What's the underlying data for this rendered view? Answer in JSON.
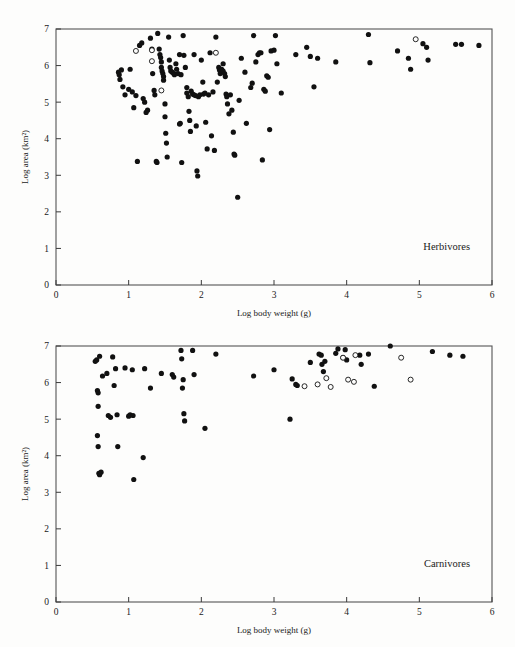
{
  "figure": {
    "background_color": "#fdfdfc",
    "point_color": "#111111",
    "axis_color": "#3a3a3a"
  },
  "chart_data": [
    {
      "type": "scatter",
      "title": "Herbivores",
      "xlabel": "Log body weight (g)",
      "ylabel": "Log area (km²)",
      "xlim": [
        0,
        6
      ],
      "ylim": [
        0,
        7
      ],
      "xticks": [
        0,
        1,
        2,
        3,
        4,
        5,
        6
      ],
      "yticks": [
        0,
        1,
        2,
        3,
        4,
        5,
        6,
        7
      ],
      "grid": false,
      "legend": "none",
      "annotation": "Herbivores",
      "annotation_position": "bottom-right",
      "series": [
        {
          "name": "filled",
          "marker": "filled-circle",
          "points": [
            [
              0.86,
              5.82
            ],
            [
              0.87,
              5.75
            ],
            [
              0.9,
              5.88
            ],
            [
              0.88,
              5.62
            ],
            [
              0.92,
              5.42
            ],
            [
              0.95,
              5.2
            ],
            [
              1.0,
              5.35
            ],
            [
              1.02,
              5.9
            ],
            [
              1.05,
              5.28
            ],
            [
              1.07,
              4.85
            ],
            [
              1.1,
              5.18
            ],
            [
              1.12,
              3.38
            ],
            [
              1.15,
              6.55
            ],
            [
              1.18,
              6.62
            ],
            [
              1.2,
              5.1
            ],
            [
              1.22,
              5.0
            ],
            [
              1.24,
              4.72
            ],
            [
              1.26,
              4.78
            ],
            [
              1.3,
              6.75
            ],
            [
              1.32,
              6.45
            ],
            [
              1.33,
              5.78
            ],
            [
              1.35,
              5.32
            ],
            [
              1.36,
              5.2
            ],
            [
              1.38,
              3.38
            ],
            [
              1.39,
              3.35
            ],
            [
              1.4,
              6.88
            ],
            [
              1.42,
              6.45
            ],
            [
              1.43,
              6.3
            ],
            [
              1.44,
              6.22
            ],
            [
              1.45,
              6.1
            ],
            [
              1.45,
              5.95
            ],
            [
              1.46,
              5.85
            ],
            [
              1.47,
              5.78
            ],
            [
              1.48,
              5.7
            ],
            [
              1.48,
              5.6
            ],
            [
              1.5,
              4.95
            ],
            [
              1.5,
              4.6
            ],
            [
              1.51,
              4.15
            ],
            [
              1.52,
              3.88
            ],
            [
              1.53,
              3.5
            ],
            [
              1.55,
              6.78
            ],
            [
              1.56,
              6.15
            ],
            [
              1.57,
              5.95
            ],
            [
              1.58,
              5.85
            ],
            [
              1.6,
              5.82
            ],
            [
              1.62,
              5.78
            ],
            [
              1.63,
              5.75
            ],
            [
              1.65,
              6.05
            ],
            [
              1.66,
              5.9
            ],
            [
              1.68,
              5.78
            ],
            [
              1.7,
              6.3
            ],
            [
              1.7,
              4.4
            ],
            [
              1.71,
              4.42
            ],
            [
              1.72,
              5.75
            ],
            [
              1.73,
              3.35
            ],
            [
              1.75,
              6.82
            ],
            [
              1.76,
              6.28
            ],
            [
              1.78,
              5.95
            ],
            [
              1.8,
              5.4
            ],
            [
              1.8,
              5.25
            ],
            [
              1.82,
              5.15
            ],
            [
              1.83,
              4.75
            ],
            [
              1.84,
              4.5
            ],
            [
              1.85,
              4.2
            ],
            [
              1.86,
              5.3
            ],
            [
              1.88,
              5.22
            ],
            [
              1.9,
              6.3
            ],
            [
              1.9,
              5.2
            ],
            [
              1.92,
              5.18
            ],
            [
              1.93,
              4.35
            ],
            [
              1.94,
              3.12
            ],
            [
              1.95,
              2.98
            ],
            [
              1.96,
              5.15
            ],
            [
              1.98,
              5.2
            ],
            [
              2.0,
              6.15
            ],
            [
              2.02,
              5.55
            ],
            [
              2.03,
              5.22
            ],
            [
              2.05,
              5.25
            ],
            [
              2.06,
              4.45
            ],
            [
              2.08,
              3.72
            ],
            [
              2.1,
              5.2
            ],
            [
              2.12,
              6.35
            ],
            [
              2.14,
              4.08
            ],
            [
              2.16,
              5.28
            ],
            [
              2.18,
              3.68
            ],
            [
              2.2,
              6.78
            ],
            [
              2.22,
              5.55
            ],
            [
              2.24,
              5.95
            ],
            [
              2.25,
              5.88
            ],
            [
              2.26,
              5.78
            ],
            [
              2.28,
              5.9
            ],
            [
              2.3,
              6.05
            ],
            [
              2.3,
              5.85
            ],
            [
              2.32,
              5.78
            ],
            [
              2.33,
              5.7
            ],
            [
              2.34,
              5.22
            ],
            [
              2.35,
              5.15
            ],
            [
              2.36,
              4.95
            ],
            [
              2.38,
              4.68
            ],
            [
              2.4,
              5.2
            ],
            [
              2.42,
              4.78
            ],
            [
              2.44,
              4.18
            ],
            [
              2.45,
              3.58
            ],
            [
              2.46,
              3.55
            ],
            [
              2.5,
              2.4
            ],
            [
              2.52,
              5.05
            ],
            [
              2.55,
              6.2
            ],
            [
              2.6,
              5.82
            ],
            [
              2.62,
              4.42
            ],
            [
              2.68,
              5.4
            ],
            [
              2.7,
              5.52
            ],
            [
              2.72,
              6.82
            ],
            [
              2.75,
              6.1
            ],
            [
              2.78,
              6.3
            ],
            [
              2.8,
              6.35
            ],
            [
              2.82,
              6.35
            ],
            [
              2.84,
              3.42
            ],
            [
              2.86,
              5.35
            ],
            [
              2.88,
              5.3
            ],
            [
              2.9,
              5.72
            ],
            [
              2.92,
              5.68
            ],
            [
              2.94,
              4.25
            ],
            [
              2.96,
              6.4
            ],
            [
              3.0,
              6.42
            ],
            [
              3.02,
              6.82
            ],
            [
              3.04,
              6.05
            ],
            [
              3.1,
              5.25
            ],
            [
              3.3,
              6.3
            ],
            [
              3.45,
              6.5
            ],
            [
              3.5,
              6.25
            ],
            [
              3.55,
              5.42
            ],
            [
              3.6,
              6.2
            ],
            [
              3.85,
              6.1
            ],
            [
              4.3,
              6.85
            ],
            [
              4.32,
              6.08
            ],
            [
              4.7,
              6.4
            ],
            [
              4.85,
              6.2
            ],
            [
              4.88,
              5.9
            ],
            [
              5.05,
              6.6
            ],
            [
              5.1,
              6.5
            ],
            [
              5.12,
              6.15
            ],
            [
              5.5,
              6.58
            ],
            [
              5.58,
              6.58
            ],
            [
              5.82,
              6.55
            ]
          ]
        },
        {
          "name": "open",
          "marker": "open-circle",
          "points": [
            [
              1.1,
              6.4
            ],
            [
              1.32,
              6.42
            ],
            [
              1.32,
              6.12
            ],
            [
              1.45,
              5.32
            ],
            [
              2.2,
              6.35
            ],
            [
              4.95,
              6.72
            ]
          ]
        }
      ]
    },
    {
      "type": "scatter",
      "title": "Carnivores",
      "xlabel": "Log body weight (g)",
      "ylabel": "Log area (km²)",
      "xlim": [
        0,
        6
      ],
      "ylim": [
        0,
        7
      ],
      "xticks": [
        0,
        1,
        2,
        3,
        4,
        5,
        6
      ],
      "yticks": [
        0,
        1,
        2,
        3,
        4,
        5,
        6,
        7
      ],
      "grid": false,
      "legend": "none",
      "annotation": "Carnivores",
      "annotation_position": "bottom-right",
      "series": [
        {
          "name": "filled",
          "marker": "filled-circle",
          "points": [
            [
              0.54,
              6.58
            ],
            [
              0.56,
              6.62
            ],
            [
              0.57,
              5.78
            ],
            [
              0.58,
              5.72
            ],
            [
              0.6,
              6.72
            ],
            [
              0.58,
              5.35
            ],
            [
              0.57,
              4.55
            ],
            [
              0.58,
              4.25
            ],
            [
              0.59,
              3.52
            ],
            [
              0.6,
              3.48
            ],
            [
              0.62,
              3.55
            ],
            [
              0.64,
              6.18
            ],
            [
              0.7,
              6.25
            ],
            [
              0.72,
              5.1
            ],
            [
              0.75,
              5.05
            ],
            [
              0.78,
              6.7
            ],
            [
              0.8,
              5.92
            ],
            [
              0.82,
              6.38
            ],
            [
              0.84,
              5.12
            ],
            [
              0.85,
              4.25
            ],
            [
              0.95,
              6.4
            ],
            [
              1.0,
              5.08
            ],
            [
              1.02,
              5.12
            ],
            [
              1.05,
              6.35
            ],
            [
              1.06,
              5.1
            ],
            [
              1.07,
              3.35
            ],
            [
              1.2,
              3.95
            ],
            [
              1.22,
              6.38
            ],
            [
              1.3,
              5.85
            ],
            [
              1.45,
              6.25
            ],
            [
              1.6,
              6.22
            ],
            [
              1.62,
              6.15
            ],
            [
              1.72,
              6.88
            ],
            [
              1.73,
              6.65
            ],
            [
              1.74,
              5.85
            ],
            [
              1.75,
              6.08
            ],
            [
              1.76,
              5.15
            ],
            [
              1.77,
              4.95
            ],
            [
              1.88,
              6.88
            ],
            [
              1.9,
              6.22
            ],
            [
              2.05,
              4.75
            ],
            [
              2.2,
              6.78
            ],
            [
              2.72,
              6.18
            ],
            [
              3.0,
              6.35
            ],
            [
              3.22,
              5.0
            ],
            [
              3.25,
              6.1
            ],
            [
              3.3,
              5.95
            ],
            [
              3.32,
              5.92
            ],
            [
              3.5,
              6.55
            ],
            [
              3.62,
              6.78
            ],
            [
              3.65,
              6.75
            ],
            [
              3.66,
              6.5
            ],
            [
              3.68,
              6.3
            ],
            [
              3.7,
              6.58
            ],
            [
              3.85,
              6.8
            ],
            [
              3.88,
              6.92
            ],
            [
              3.95,
              6.68
            ],
            [
              3.98,
              6.9
            ],
            [
              4.0,
              6.62
            ],
            [
              4.18,
              6.75
            ],
            [
              4.2,
              6.5
            ],
            [
              4.3,
              6.78
            ],
            [
              4.38,
              5.9
            ],
            [
              4.6,
              7.0
            ],
            [
              5.18,
              6.85
            ],
            [
              5.42,
              6.75
            ],
            [
              5.6,
              6.72
            ]
          ]
        },
        {
          "name": "open",
          "marker": "open-circle",
          "points": [
            [
              3.42,
              5.9
            ],
            [
              3.6,
              5.95
            ],
            [
              3.72,
              6.12
            ],
            [
              3.78,
              5.88
            ],
            [
              3.95,
              6.68
            ],
            [
              4.02,
              6.08
            ],
            [
              4.1,
              6.02
            ],
            [
              4.12,
              6.75
            ],
            [
              4.75,
              6.68
            ],
            [
              4.88,
              6.08
            ]
          ]
        }
      ]
    }
  ]
}
